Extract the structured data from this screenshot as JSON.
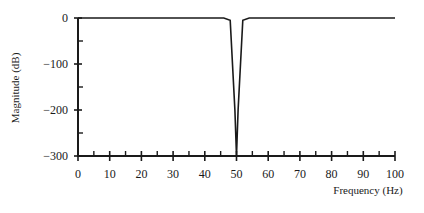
{
  "chart_data": {
    "type": "line",
    "title": "",
    "xlabel": "Frequency (Hz)",
    "ylabel": "Magnitude (dB)",
    "xlim": [
      0,
      100
    ],
    "ylim": [
      -300,
      0
    ],
    "xticks": [
      0,
      10,
      20,
      30,
      40,
      50,
      60,
      70,
      80,
      90,
      100
    ],
    "yticks": [
      0,
      -100,
      -200,
      -300
    ],
    "x_minor_ticks": [
      5,
      15,
      25,
      35,
      45,
      55,
      65,
      75,
      85,
      95
    ],
    "y_minor_ticks": [
      -50,
      -150,
      -250
    ],
    "grid": false,
    "legend": null,
    "series": [
      {
        "name": "Notch filter response",
        "x": [
          0,
          46,
          48,
          49.5,
          50,
          50.5,
          52,
          54,
          100
        ],
        "y": [
          0,
          0,
          -5,
          -200,
          -300,
          -200,
          -5,
          0,
          0
        ]
      }
    ],
    "colors": {
      "line": "#1a1a1a",
      "axis": "#1a1a1a",
      "background": "#ffffff"
    }
  }
}
